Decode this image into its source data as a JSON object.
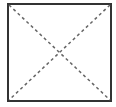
{
  "diagram": {
    "shape": "square-with-dashed-diagonals",
    "box": {
      "x": 8,
      "y": 4,
      "width": 103,
      "height": 97,
      "stroke": "#333333",
      "stroke_width": 2
    },
    "diagonals": {
      "stroke": "#666666",
      "stroke_width": 1.5,
      "dash": "3,3"
    }
  }
}
